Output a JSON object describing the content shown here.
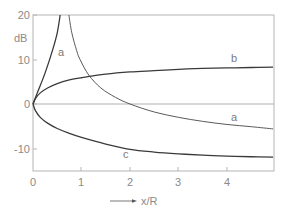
{
  "chart_data": {
    "type": "line",
    "title": "",
    "xlabel": "x/R",
    "ylabel": "dB",
    "xlim": [
      0,
      4.95
    ],
    "ylim": [
      -15,
      20
    ],
    "x_ticks": [
      "0",
      "1",
      "2",
      "3",
      "4"
    ],
    "y_ticks": [
      "20",
      "10",
      "0",
      "-10"
    ],
    "grid": false,
    "legend": "inline curve labels",
    "series": [
      {
        "name": "a",
        "note": "singular near x/R≈0.65; two branches",
        "branches": [
          {
            "x": [
              0,
              0.1,
              0.25,
              0.4,
              0.5,
              0.56
            ],
            "y": [
              0,
              2.8,
              7,
              12,
              16,
              20
            ]
          },
          {
            "x": [
              0.74,
              0.8,
              0.9,
              0.97,
              1.15,
              1.4,
              1.7,
              2.0,
              2.5,
              3.0,
              3.5,
              4.0,
              4.5,
              4.95
            ],
            "y": [
              20,
              16,
              12,
              10,
              6.5,
              3.6,
              1.5,
              0,
              -1.8,
              -3.0,
              -3.9,
              -4.6,
              -5.1,
              -5.6
            ]
          }
        ]
      },
      {
        "name": "b",
        "x": [
          0,
          0.05,
          0.15,
          0.3,
          0.5,
          0.75,
          1.0,
          1.5,
          2.0,
          2.5,
          3.0,
          3.5,
          4.0,
          4.5,
          4.95
        ],
        "y": [
          0,
          1.2,
          2.5,
          3.6,
          4.6,
          5.4,
          5.9,
          6.7,
          7.2,
          7.5,
          7.8,
          8.0,
          8.1,
          8.2,
          8.3
        ]
      },
      {
        "name": "c",
        "x": [
          0,
          0.05,
          0.15,
          0.3,
          0.5,
          0.75,
          1.0,
          1.5,
          2.0,
          2.5,
          3.0,
          3.5,
          4.0,
          4.5,
          4.95
        ],
        "y": [
          0,
          -1.5,
          -3.0,
          -4.3,
          -5.5,
          -6.6,
          -7.5,
          -9.0,
          -10.2,
          -10.8,
          -11.2,
          -11.5,
          -11.7,
          -11.85,
          -11.95
        ]
      }
    ],
    "annotations": [
      {
        "text": "a",
        "x": 0.6,
        "y": 11.5
      },
      {
        "text": "b",
        "x": 4.15,
        "y": 10.3
      },
      {
        "text": "a",
        "x": 4.15,
        "y": -3.1
      },
      {
        "text": "c",
        "x": 1.9,
        "y": -11.3
      }
    ],
    "reference_lines": [
      {
        "y": 0
      }
    ]
  },
  "labels": {
    "ylabel": "dB",
    "xlabel": "x/R",
    "x_ticks": [
      "0",
      "1",
      "2",
      "3",
      "4"
    ],
    "y_ticks": [
      "20",
      "10",
      "0",
      "-10"
    ],
    "curve_a_upper": "a",
    "curve_a_lower": "a",
    "curve_b": "b",
    "curve_c": "c"
  }
}
